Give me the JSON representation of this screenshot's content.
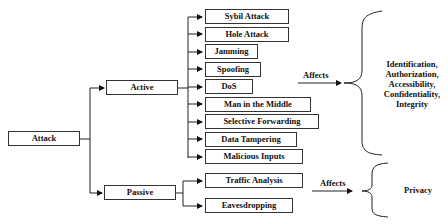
{
  "diagram": {
    "root": {
      "label": "Attack"
    },
    "branches": [
      {
        "label": "Active",
        "children": [
          "Sybil Attack",
          "Hole Attack",
          "Jamming",
          "Spoofing",
          "DoS",
          "Man in the Middle",
          "Selective Forwarding",
          "Data Tampering",
          "Malicious Inputs"
        ],
        "affects_label": "Affects",
        "effects": [
          "Identification,",
          "Authorization,",
          "Accessibility,",
          "Confidentiality,",
          "Integrity"
        ]
      },
      {
        "label": "Passive",
        "children": [
          "Traffic Analysis",
          "Eavesdropping"
        ],
        "affects_label": "Affects",
        "effects": [
          "Privacy"
        ]
      }
    ]
  }
}
